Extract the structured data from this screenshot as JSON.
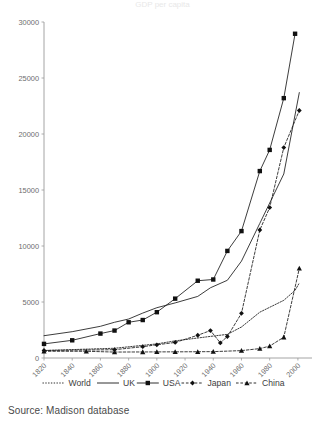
{
  "figure": {
    "source_note": "Source: Madison database",
    "title_partial": "GDP per capita"
  },
  "chart_data": {
    "type": "line",
    "title": "",
    "xlabel": "",
    "ylabel": "",
    "xlim": [
      1820,
      2010
    ],
    "ylim": [
      0,
      30000
    ],
    "ytick_values": [
      0,
      5000,
      10000,
      15000,
      20000,
      25000,
      30000
    ],
    "ytick_labels": [
      "0",
      "5000",
      "10000",
      "15000",
      "20000",
      "25000",
      "30000"
    ],
    "xtick_values": [
      1820,
      1840,
      1860,
      1880,
      1900,
      1920,
      1940,
      1960,
      1980,
      2000
    ],
    "xtick_labels": [
      "1820",
      "1840",
      "1860",
      "1880",
      "1900",
      "1920",
      "1940",
      "1960",
      "1980",
      "2000"
    ],
    "grid": false,
    "legend_position": "bottom",
    "series": [
      {
        "name": "World",
        "style": "dotted",
        "marker": "none",
        "x": [
          1820,
          1870,
          1900,
          1913,
          1940,
          1950,
          1960,
          1973,
          1990,
          1998,
          2001
        ],
        "values": [
          670,
          870,
          1260,
          1530,
          1960,
          2110,
          2770,
          4090,
          5150,
          6040,
          6700
        ]
      },
      {
        "name": "UK",
        "style": "solid",
        "marker": "none",
        "x": [
          1820,
          1840,
          1860,
          1870,
          1880,
          1890,
          1900,
          1913,
          1929,
          1938,
          1950,
          1960,
          1973,
          1990,
          2001
        ],
        "values": [
          1990,
          2350,
          2830,
          3190,
          3480,
          4010,
          4490,
          4920,
          5500,
          6270,
          6940,
          8650,
          12020,
          16430,
          23700
        ]
      },
      {
        "name": "USA",
        "style": "solid",
        "marker": "square",
        "x": [
          1820,
          1840,
          1860,
          1870,
          1880,
          1890,
          1900,
          1913,
          1929,
          1940,
          1950,
          1960,
          1973,
          1980,
          1990,
          1998
        ],
        "values": [
          1260,
          1580,
          2180,
          2450,
          3190,
          3390,
          4090,
          5300,
          6900,
          7010,
          9560,
          11330,
          16690,
          18580,
          23200,
          28950
        ]
      },
      {
        "name": "Japan",
        "style": "dashed",
        "marker": "diamond",
        "x": [
          1820,
          1870,
          1890,
          1900,
          1913,
          1929,
          1938,
          1945,
          1950,
          1960,
          1973,
          1980,
          1990,
          2001
        ],
        "values": [
          670,
          740,
          1010,
          1180,
          1390,
          2030,
          2450,
          1350,
          1920,
          3990,
          11430,
          13430,
          18790,
          22100
        ]
      },
      {
        "name": "China",
        "style": "dashed",
        "marker": "triangle",
        "x": [
          1820,
          1850,
          1870,
          1890,
          1900,
          1913,
          1929,
          1940,
          1960,
          1973,
          1980,
          1990,
          2001
        ],
        "values": [
          600,
          600,
          530,
          540,
          545,
          550,
          560,
          570,
          660,
          840,
          1060,
          1860,
          8000
        ]
      }
    ]
  },
  "legend": {
    "items": [
      {
        "label": "World",
        "style": "dotted",
        "marker": "none"
      },
      {
        "label": "UK",
        "style": "solid",
        "marker": "none"
      },
      {
        "label": "USA",
        "style": "solid",
        "marker": "square"
      },
      {
        "label": "Japan",
        "style": "dashed",
        "marker": "diamond"
      },
      {
        "label": "China",
        "style": "dashed",
        "marker": "triangle"
      }
    ]
  }
}
